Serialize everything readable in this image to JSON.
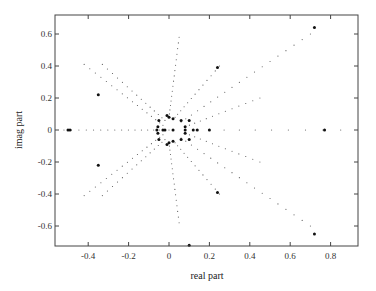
{
  "chart_data": {
    "type": "scatter",
    "title": "",
    "xlabel": "real part",
    "ylabel": "imag part",
    "xlim": [
      -0.57,
      0.93
    ],
    "ylim": [
      -0.72,
      0.72
    ],
    "xticks": [
      -0.4,
      -0.2,
      0,
      0.2,
      0.4,
      0.6,
      0.8
    ],
    "xtick_labels": [
      "-0.4",
      "-0.2",
      "0",
      "0.2",
      "0.4",
      "0.6",
      "0.8"
    ],
    "yticks": [
      -0.6,
      -0.4,
      -0.2,
      0,
      0.2,
      0.4,
      0.6
    ],
    "ytick_labels": [
      "-0.6",
      "-0.4",
      "-0.2",
      "0",
      "0.2",
      "0.4",
      "0.6"
    ],
    "grid": false,
    "legend": null,
    "series": [
      {
        "name": "root-locus-trails",
        "marker": "small-dot",
        "color": "#555555",
        "rays": [
          {
            "from": [
              0.0,
              0.0
            ],
            "to": [
              -0.52,
              0.0
            ],
            "n": 16
          },
          {
            "from": [
              -0.03,
              0.03
            ],
            "to": [
              -0.42,
              0.41
            ],
            "n": 16
          },
          {
            "from": [
              -0.03,
              -0.03
            ],
            "to": [
              -0.42,
              -0.41
            ],
            "n": 16
          },
          {
            "from": [
              -0.02,
              0.06
            ],
            "to": [
              -0.33,
              0.41
            ],
            "n": 14
          },
          {
            "from": [
              -0.02,
              -0.06
            ],
            "to": [
              -0.33,
              -0.41
            ],
            "n": 14
          },
          {
            "from": [
              0.0,
              0.08
            ],
            "to": [
              0.05,
              0.58
            ],
            "n": 16
          },
          {
            "from": [
              0.0,
              -0.08
            ],
            "to": [
              0.05,
              -0.58
            ],
            "n": 16
          },
          {
            "from": [
              0.03,
              0.08
            ],
            "to": [
              0.25,
              0.4
            ],
            "n": 12
          },
          {
            "from": [
              0.03,
              -0.08
            ],
            "to": [
              0.25,
              -0.4
            ],
            "n": 12
          },
          {
            "from": [
              0.06,
              0.05
            ],
            "to": [
              0.7,
              0.6
            ],
            "n": 18
          },
          {
            "from": [
              0.06,
              -0.05
            ],
            "to": [
              0.7,
              -0.6
            ],
            "n": 18
          },
          {
            "from": [
              0.08,
              0.02
            ],
            "to": [
              0.45,
              0.2
            ],
            "n": 12
          },
          {
            "from": [
              0.08,
              -0.02
            ],
            "to": [
              0.45,
              -0.2
            ],
            "n": 12
          },
          {
            "from": [
              0.08,
              0.0
            ],
            "to": [
              0.85,
              0.0
            ],
            "n": 10
          }
        ]
      },
      {
        "name": "poles",
        "marker": "large-dot",
        "color": "#111111",
        "points": [
          [
            -0.5,
            0.0
          ],
          [
            -0.49,
            0.0
          ],
          [
            -0.35,
            0.22
          ],
          [
            -0.35,
            -0.22
          ],
          [
            -0.05,
            0.06
          ],
          [
            -0.05,
            -0.06
          ],
          [
            -0.06,
            0.0
          ],
          [
            -0.055,
            0.02
          ],
          [
            -0.055,
            -0.02
          ],
          [
            -0.03,
            0.0
          ],
          [
            -0.02,
            0.0
          ],
          [
            -0.01,
            0.09
          ],
          [
            -0.01,
            -0.09
          ],
          [
            0.0,
            0.08
          ],
          [
            0.0,
            -0.08
          ],
          [
            0.02,
            0.07
          ],
          [
            0.02,
            -0.07
          ],
          [
            0.02,
            0.0
          ],
          [
            0.06,
            0.06
          ],
          [
            0.06,
            -0.06
          ],
          [
            0.08,
            0.02
          ],
          [
            0.08,
            -0.02
          ],
          [
            0.08,
            0.0
          ],
          [
            0.12,
            0.0
          ],
          [
            0.14,
            0.0
          ],
          [
            0.1,
            0.06
          ],
          [
            0.1,
            -0.06
          ],
          [
            0.2,
            0.0
          ],
          [
            0.24,
            0.39
          ],
          [
            0.24,
            -0.39
          ],
          [
            0.72,
            0.64
          ],
          [
            0.72,
            -0.65
          ],
          [
            0.77,
            0.0
          ],
          [
            0.1,
            -0.72
          ]
        ]
      }
    ]
  },
  "axes": {
    "xlabel": "real part",
    "ylabel": "imag part"
  }
}
